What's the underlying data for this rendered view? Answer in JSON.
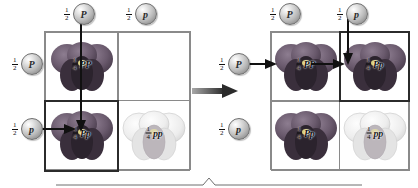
{
  "diagram": {
    "allele_dominant": "P",
    "allele_recessive": "p",
    "gamete_fraction": "1/2",
    "offspring_fraction": "1/4",
    "fraction_numerator": "1",
    "gamete_denominator": "2",
    "offspring_denominator": "4",
    "transition_arrow": "right-arrow"
  },
  "left_panel": {
    "name": "punnett-square-step-1",
    "top_gametes": [
      {
        "fraction_num": "1",
        "fraction_den": "2",
        "allele": "P",
        "name": "gamete-top-left"
      },
      {
        "fraction_num": "1",
        "fraction_den": "2",
        "allele": "p",
        "name": "gamete-top-right"
      }
    ],
    "side_gametes": [
      {
        "fraction_num": "1",
        "fraction_den": "2",
        "allele": "P",
        "name": "gamete-side-top"
      },
      {
        "fraction_num": "1",
        "fraction_den": "2",
        "allele": "p",
        "name": "gamete-side-bottom"
      }
    ],
    "cells": [
      {
        "row": 0,
        "col": 0,
        "fraction_num": "1",
        "fraction_den": "4",
        "genotype": "PP",
        "phenotype": "purple",
        "filled": true,
        "highlighted": false
      },
      {
        "row": 0,
        "col": 1,
        "fraction_num": "",
        "fraction_den": "",
        "genotype": "",
        "phenotype": "empty",
        "filled": false,
        "highlighted": false
      },
      {
        "row": 1,
        "col": 0,
        "fraction_num": "1",
        "fraction_den": "4",
        "genotype": "Pp",
        "phenotype": "purple",
        "filled": true,
        "highlighted": true
      },
      {
        "row": 1,
        "col": 1,
        "fraction_num": "1",
        "fraction_den": "4",
        "genotype": "pp",
        "phenotype": "white",
        "filled": true,
        "highlighted": false
      }
    ]
  },
  "right_panel": {
    "name": "punnett-square-step-2",
    "top_gametes": [
      {
        "fraction_num": "1",
        "fraction_den": "2",
        "allele": "P",
        "name": "gamete-top-left"
      },
      {
        "fraction_num": "1",
        "fraction_den": "2",
        "allele": "p",
        "name": "gamete-top-right"
      }
    ],
    "side_gametes": [
      {
        "fraction_num": "1",
        "fraction_den": "2",
        "allele": "P",
        "name": "gamete-side-top"
      },
      {
        "fraction_num": "1",
        "fraction_den": "2",
        "allele": "p",
        "name": "gamete-side-bottom"
      }
    ],
    "cells": [
      {
        "row": 0,
        "col": 0,
        "fraction_num": "1",
        "fraction_den": "4",
        "genotype": "PP",
        "phenotype": "purple",
        "filled": true,
        "highlighted": false
      },
      {
        "row": 0,
        "col": 1,
        "fraction_num": "1",
        "fraction_den": "4",
        "genotype": "Pp",
        "phenotype": "purple",
        "filled": true,
        "highlighted": true
      },
      {
        "row": 1,
        "col": 0,
        "fraction_num": "1",
        "fraction_den": "4",
        "genotype": "Pp",
        "phenotype": "purple",
        "filled": true,
        "highlighted": false
      },
      {
        "row": 1,
        "col": 1,
        "fraction_num": "1",
        "fraction_den": "4",
        "genotype": "pp",
        "phenotype": "white",
        "filled": true,
        "highlighted": false
      }
    ]
  },
  "colors": {
    "grid_line": "#8a8a8a",
    "highlight_border": "#2b2b2b",
    "arrow": "#111111",
    "purple_flower": "#6b5a6e",
    "white_flower": "#e9e9ea"
  }
}
